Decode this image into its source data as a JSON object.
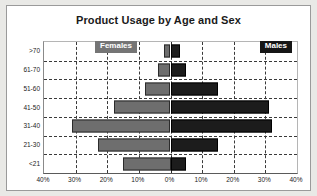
{
  "chart_data": {
    "type": "bar",
    "subtype": "population-pyramid",
    "title": "Product Usage by Age and Sex",
    "xlabel": "",
    "ylabel": "",
    "categories": [
      "<21",
      "21-30",
      "31-40",
      "41-50",
      "51-60",
      "61-70",
      ">70"
    ],
    "categories_top_to_bottom": [
      ">70",
      "61-70",
      "51-60",
      "41-50",
      "31-40",
      "21-30",
      "<21"
    ],
    "series": [
      {
        "name": "Females",
        "side": "left",
        "color": "#6e6e6e",
        "values": [
          15,
          23,
          31,
          18,
          8,
          4,
          2
        ]
      },
      {
        "name": "Males",
        "side": "right",
        "color": "#1c1c1c",
        "values": [
          5,
          15,
          32,
          31,
          15,
          5,
          3
        ]
      }
    ],
    "xlim": [
      0,
      40
    ],
    "xtick_labels": [
      "40%",
      "30%",
      "20%",
      "10%",
      "0%",
      "10%",
      "20%",
      "30%",
      "40%"
    ],
    "xtick_values": [
      40,
      30,
      20,
      10,
      0,
      10,
      20,
      30,
      40
    ],
    "grid": true,
    "grid_style": "dashed",
    "legend_position": "inside-top-corners",
    "units": "percent"
  },
  "chart": {
    "title": "Product Usage by Age and Sex",
    "legend": {
      "females": "Females",
      "males": "Males"
    },
    "y_ticks": [
      ">70",
      "61-70",
      "51-60",
      "41-50",
      "31-40",
      "21-30",
      "<21"
    ],
    "x_ticks": [
      "40%",
      "30%",
      "20%",
      "10%",
      "0%",
      "10%",
      "20%",
      "30%",
      "40%"
    ]
  },
  "colors": {
    "female_bar": "#6e6e6e",
    "male_bar": "#1c1c1c",
    "female_legend_bg": "#757575",
    "male_legend_bg": "#161616",
    "grid": "#3a3a3a",
    "card_bg": "#ffffff",
    "page_bg": "#e9e9e6",
    "text": "#1a1a1a"
  }
}
